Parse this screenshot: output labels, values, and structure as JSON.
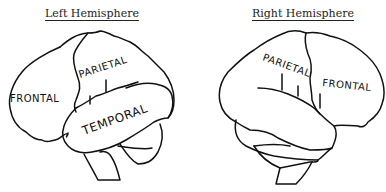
{
  "figure": {
    "left_panel": {
      "title": "Left Hemisphere",
      "labels": {
        "frontal": "FRONTAL",
        "parietal": "PARIETAL",
        "temporal": "TEMPORAL"
      }
    },
    "right_panel": {
      "title": "Right Hemisphere",
      "labels": {
        "parietal": "PARIETAL",
        "frontal": "FRONTAL"
      }
    },
    "line_color": "#111111",
    "background": "#ffffff"
  }
}
